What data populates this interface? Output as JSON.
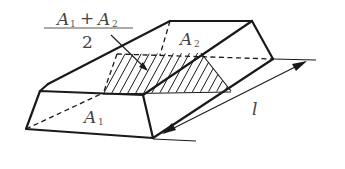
{
  "diagram": {
    "labels": {
      "fraction_numerator_a": "A",
      "fraction_numerator_a_sub": "1",
      "fraction_plus": "+",
      "fraction_numerator_b": "A",
      "fraction_numerator_b_sub": "2",
      "fraction_denominator": "2",
      "top_face": "A",
      "top_face_sub": "2",
      "front_face": "A",
      "front_face_sub": "1",
      "length": "l"
    },
    "colors": {
      "ink": "#1a1a1a",
      "text": "#444444",
      "background": "#ffffff"
    }
  }
}
